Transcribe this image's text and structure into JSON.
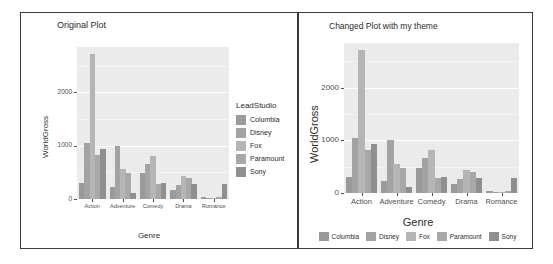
{
  "figure": {
    "left_panel": {
      "title": "Original Plot",
      "legend_title": "LeadStudio",
      "legend_position": "right"
    },
    "right_panel": {
      "title": "Changed Plot with my theme",
      "legend_title": "",
      "legend_position": "bottom"
    }
  },
  "palette": {
    "columbia": "#9a9a9a",
    "disney": "#a3a3a3",
    "fox": "#b5b5b5",
    "paramount": "#a8a8a8",
    "sony": "#8f8f8f",
    "panel_bg": "#ebebeb",
    "grid": "#ffffff",
    "axis_text": "#4d4d4d",
    "frame": "#3a3a3a"
  },
  "chart_data": [
    {
      "type": "bar",
      "title": "Original Plot",
      "xlabel": "Genre",
      "ylabel": "WorldGross",
      "categories": [
        "Action",
        "Adventure",
        "Comedy",
        "Drama",
        "Romance"
      ],
      "ylim": [
        0,
        2850
      ],
      "yticks": [
        0,
        1000,
        2000
      ],
      "ytick_labels": [
        "0",
        "1000",
        "2000"
      ],
      "grid": true,
      "legend_title": "LeadStudio",
      "legend_position": "right",
      "series": [
        {
          "name": "Columbia",
          "values": [
            300,
            230,
            480,
            170,
            40
          ]
        },
        {
          "name": "Disney",
          "values": [
            1050,
            1000,
            660,
            260,
            20
          ]
        },
        {
          "name": "Fox",
          "values": [
            2720,
            560,
            810,
            440,
            25
          ]
        },
        {
          "name": "Paramount",
          "values": [
            820,
            480,
            290,
            400,
            30
          ]
        },
        {
          "name": "Sony",
          "values": [
            930,
            110,
            300,
            290,
            290
          ]
        }
      ]
    },
    {
      "type": "bar",
      "title": "Changed Plot with my theme",
      "xlabel": "Genre",
      "ylabel": "WorldGross",
      "categories": [
        "Action",
        "Adventure",
        "Comedy",
        "Drama",
        "Romance"
      ],
      "ylim": [
        0,
        2850
      ],
      "yticks": [
        0,
        1000,
        2000
      ],
      "ytick_labels": [
        "0",
        "1000",
        "2000"
      ],
      "grid": true,
      "legend_title": "",
      "legend_position": "bottom",
      "series": [
        {
          "name": "Columbia",
          "values": [
            300,
            230,
            480,
            170,
            40
          ]
        },
        {
          "name": "Disney",
          "values": [
            1050,
            1000,
            660,
            260,
            20
          ]
        },
        {
          "name": "Fox",
          "values": [
            2720,
            560,
            810,
            440,
            25
          ]
        },
        {
          "name": "Paramount",
          "values": [
            820,
            480,
            290,
            400,
            30
          ]
        },
        {
          "name": "Sony",
          "values": [
            930,
            110,
            300,
            290,
            290
          ]
        }
      ]
    }
  ]
}
